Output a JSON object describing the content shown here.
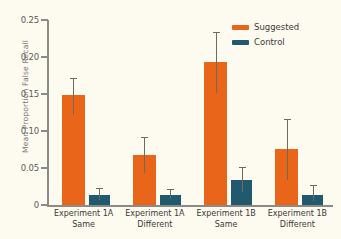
{
  "chart_data": {
    "type": "bar",
    "title": "",
    "xlabel": "",
    "ylabel": "Mean Proportion False Recall",
    "ylim": [
      0,
      0.25
    ],
    "grid": false,
    "legend_position": "top-right",
    "categories": [
      "Experiment 1A Same",
      "Experiment 1A Different",
      "Experiment 1B Same",
      "Experiment 1B Different"
    ],
    "category_lines": [
      {
        "line1": "Experiment 1A",
        "line2": "Same"
      },
      {
        "line1": "Experiment 1A",
        "line2": "Different"
      },
      {
        "line1": "Experiment 1B",
        "line2": "Same"
      },
      {
        "line1": "Experiment 1B",
        "line2": "Different"
      }
    ],
    "ytick_labels": [
      "0.25",
      "0.20",
      "0.15",
      "0.10",
      "0.05",
      "0"
    ],
    "ytick_values": [
      0.25,
      0.2,
      0.15,
      0.1,
      0.05,
      0
    ],
    "series": [
      {
        "name": "Suggested",
        "color": "#e8651a",
        "values": [
          0.148,
          0.068,
          0.193,
          0.076
        ],
        "error_low": [
          0.122,
          0.043,
          0.152,
          0.034
        ],
        "error_high": [
          0.17,
          0.091,
          0.232,
          0.115
        ]
      },
      {
        "name": "Control",
        "color": "#21596e",
        "values": [
          0.013,
          0.013,
          0.034,
          0.014
        ],
        "error_low": [
          0.007,
          0.008,
          0.018,
          0.006
        ],
        "error_high": [
          0.022,
          0.02,
          0.05,
          0.026
        ]
      }
    ]
  },
  "legend": {
    "items": [
      {
        "label": "Suggested",
        "color": "#e8651a"
      },
      {
        "label": "Control",
        "color": "#21596e"
      }
    ]
  },
  "colors": {
    "background": "#fdfaef",
    "suggested": "#e8651a",
    "control": "#21596e",
    "axis": "#8a8a86",
    "error": "#6e6a60",
    "tick_text": "#5d5d5a",
    "label_text": "#3b3b39",
    "ylabel_text": "#77777a"
  }
}
